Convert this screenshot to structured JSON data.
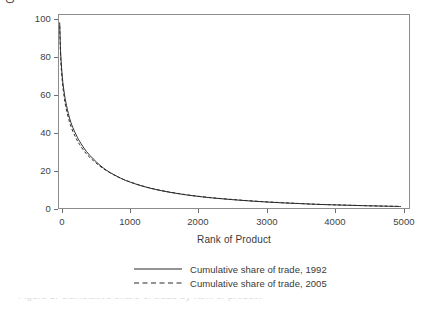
{
  "chart_data": {
    "type": "line",
    "title": "",
    "subtitle": "",
    "xlabel": "Rank of Product",
    "ylabel": "Cumulative Share of Trade",
    "xlim": [
      0,
      5120
    ],
    "ylim": [
      0,
      104
    ],
    "grid": false,
    "legend_position": "bottom",
    "xticks": [
      "0",
      "1000",
      "2000",
      "3000",
      "4000",
      "5000"
    ],
    "xtick_values": [
      0,
      1000,
      2000,
      3000,
      4000,
      5000
    ],
    "yticks": [
      "0",
      "20",
      "40",
      "60",
      "80",
      "100"
    ],
    "ytick_values": [
      0,
      20,
      40,
      60,
      80,
      100
    ],
    "x": [
      10,
      25,
      50,
      75,
      100,
      150,
      200,
      250,
      300,
      400,
      500,
      600,
      700,
      800,
      900,
      1000,
      1200,
      1400,
      1600,
      1800,
      2000,
      2250,
      2500,
      2750,
      3000,
      3250,
      3500,
      3750,
      4000,
      4250,
      4500,
      4750,
      5000
    ],
    "series": [
      {
        "name": "Cumulative share of trade, 1992",
        "style": "solid",
        "color": "#2b2b2b",
        "values": [
          100,
          83,
          70,
          62.5,
          57,
          49,
          43.5,
          39.5,
          36,
          30.5,
          26.5,
          23,
          20.2,
          18,
          16.1,
          14.5,
          12,
          10.1,
          8.6,
          7.4,
          6.4,
          5.4,
          4.6,
          3.9,
          3.3,
          2.8,
          2.4,
          2.0,
          1.7,
          1.45,
          1.2,
          1.0,
          0.8
        ]
      },
      {
        "name": "Cumulative share of trade, 2005",
        "style": "dashed",
        "color": "#2b2b2b",
        "values": [
          98,
          80.5,
          67.5,
          60,
          54.5,
          46.8,
          41.5,
          37.6,
          34.3,
          29.2,
          25.6,
          22.5,
          20.0,
          17.9,
          16.1,
          14.6,
          12.1,
          10.2,
          8.7,
          7.5,
          6.5,
          5.5,
          4.7,
          4.0,
          3.4,
          2.9,
          2.45,
          2.05,
          1.75,
          1.5,
          1.25,
          1.05,
          0.85
        ]
      }
    ]
  },
  "axes": {
    "y_title": "Cumulative Share of Trade",
    "x_title": "Rank of Product"
  },
  "legend": {
    "items": [
      {
        "label": "Cumulative share of trade, 1992",
        "style": "solid"
      },
      {
        "label": "Cumulative share of trade, 2005",
        "style": "dashed"
      }
    ]
  },
  "caption_remnant": "Figure 1. Cumulative share of trade by rank of product"
}
